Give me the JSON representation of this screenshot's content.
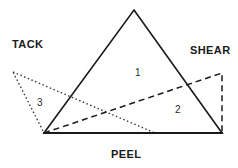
{
  "diagram": {
    "width": 238,
    "height": 168,
    "background_color": "#ffffff",
    "axis_labels": [
      {
        "id": "tack",
        "text": "TACK",
        "x": 12,
        "y": 39
      },
      {
        "id": "shear",
        "text": "SHEAR",
        "x": 190,
        "y": 45
      },
      {
        "id": "peel",
        "text": "PEEL",
        "x": 111,
        "y": 149
      }
    ],
    "region_labels": [
      {
        "id": "region-1",
        "text": "1",
        "x": 135,
        "y": 68
      },
      {
        "id": "region-2",
        "text": "2",
        "x": 175,
        "y": 105
      },
      {
        "id": "region-3",
        "text": "3",
        "x": 37,
        "y": 98
      }
    ],
    "shapes": [
      {
        "id": "solid-triangle",
        "name": "formulation-1-solid-triangle",
        "style": "solid",
        "stroke_color": "#1a1a1a",
        "stroke_width": 1.6,
        "fill": "none",
        "points": "134,10 222,133 44,133",
        "closed": true,
        "vertices": [
          {
            "label": "apex",
            "x": 134,
            "y": 10
          },
          {
            "label": "bottom-right",
            "x": 222,
            "y": 133
          },
          {
            "label": "bottom-left",
            "x": 44,
            "y": 133
          }
        ]
      },
      {
        "id": "dashed-quad",
        "name": "formulation-2-dashed-quadrilateral",
        "style": "dashed",
        "stroke_color": "#1a1a1a",
        "stroke_width": 1.5,
        "dash_pattern": "6,4",
        "fill": "none",
        "points": "44,133 222,73 222,133",
        "closed": true,
        "vertices": [
          {
            "label": "bottom-left",
            "x": 44,
            "y": 133
          },
          {
            "label": "top-right",
            "x": 222,
            "y": 73
          },
          {
            "label": "bottom-right",
            "x": 222,
            "y": 133
          }
        ]
      },
      {
        "id": "dotted-triangle",
        "name": "formulation-3-dotted-triangle",
        "style": "dotted",
        "stroke_color": "#3a3a3a",
        "stroke_width": 1.4,
        "dash_pattern": "1.5,2.5",
        "fill": "none",
        "points": "13,72 155,133 44,133",
        "closed": true,
        "vertices": [
          {
            "label": "left-apex",
            "x": 13,
            "y": 72
          },
          {
            "label": "baseline-right",
            "x": 155,
            "y": 133
          },
          {
            "label": "baseline-left",
            "x": 44,
            "y": 133
          }
        ]
      },
      {
        "id": "baseline",
        "name": "shared-baseline",
        "style": "solid",
        "stroke_color": "#1a1a1a",
        "stroke_width": 1.8,
        "fill": "none",
        "points": "44,133 222,133",
        "closed": false,
        "vertices": [
          {
            "label": "left",
            "x": 44,
            "y": 133
          },
          {
            "label": "right",
            "x": 222,
            "y": 133
          }
        ]
      }
    ]
  }
}
